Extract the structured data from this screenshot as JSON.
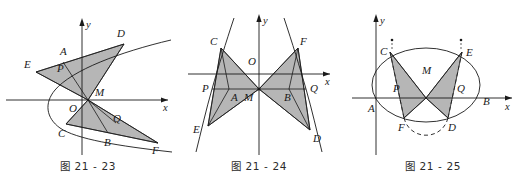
{
  "page": {
    "background_color": "#ffffff",
    "width": 524,
    "height": 184,
    "line_color": "#1a1a1a",
    "shade_color": "#a9a9a9",
    "shade_opacity": 0.85
  },
  "figures": [
    {
      "id": "21-23",
      "caption": "图 21 - 23",
      "conic": "parabola",
      "conic_note": "rightward-opening parabola with vertex at left on the x-axis",
      "axes": {
        "x_label": "x",
        "y_label": "y",
        "origin_label": "O"
      },
      "points": [
        {
          "name": "A",
          "label": "A"
        },
        {
          "name": "B",
          "label": "B"
        },
        {
          "name": "C",
          "label": "C"
        },
        {
          "name": "D",
          "label": "D"
        },
        {
          "name": "E",
          "label": "E"
        },
        {
          "name": "F",
          "label": "F"
        },
        {
          "name": "M",
          "label": "M"
        },
        {
          "name": "O",
          "label": "O"
        },
        {
          "name": "P",
          "label": "P"
        },
        {
          "name": "Q",
          "label": "Q"
        }
      ],
      "shaded_regions": [
        "triangle E-D-M (upper)",
        "triangle C-F-M (lower)"
      ]
    },
    {
      "id": "21-24",
      "caption": "图 21 - 24",
      "conic": "hyperbola",
      "conic_note": "hyperbola with two branches opening left and right, drawn steeply",
      "axes": {
        "x_label": "x",
        "y_label": "y",
        "origin_label": "O"
      },
      "points": [
        {
          "name": "A",
          "label": "A"
        },
        {
          "name": "B",
          "label": "B"
        },
        {
          "name": "C",
          "label": "C"
        },
        {
          "name": "D",
          "label": "D"
        },
        {
          "name": "E",
          "label": "E"
        },
        {
          "name": "F",
          "label": "F"
        },
        {
          "name": "M",
          "label": "M"
        },
        {
          "name": "O",
          "label": "O"
        },
        {
          "name": "P",
          "label": "P"
        },
        {
          "name": "Q",
          "label": "Q"
        }
      ],
      "shaded_regions": [
        "triangle C-E-M (left, bow-tie upper-left to lower-left)",
        "triangle F-D-M (right, bow-tie upper-right to lower-right)"
      ]
    },
    {
      "id": "21-25",
      "caption": "图 21 - 25",
      "conic": "ellipse",
      "conic_note": "ellipse centered near the y-axis with a dashed arc below, plus dotted marks above C and E",
      "axes": {
        "x_label": "x",
        "y_label": "y"
      },
      "points": [
        {
          "name": "A",
          "label": "A"
        },
        {
          "name": "B",
          "label": "B"
        },
        {
          "name": "C",
          "label": "C"
        },
        {
          "name": "D",
          "label": "D"
        },
        {
          "name": "E",
          "label": "E"
        },
        {
          "name": "F",
          "label": "F"
        },
        {
          "name": "M",
          "label": "M"
        },
        {
          "name": "P",
          "label": "P"
        },
        {
          "name": "Q",
          "label": "Q"
        }
      ],
      "shaded_regions": [
        "triangle C-F-M (left)",
        "triangle E-D-M (right)"
      ]
    }
  ]
}
